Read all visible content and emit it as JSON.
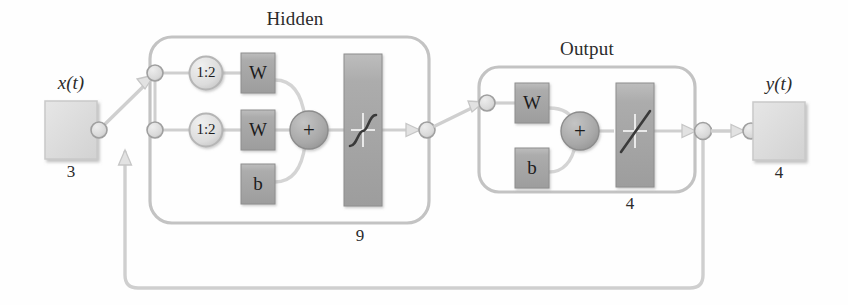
{
  "diagram": {
    "type": "neural-network-block-diagram",
    "title_visible": false,
    "background_color": "#fefefe",
    "line_color": "#b9b9b9",
    "block_fill": "#a9a9a9",
    "light_block_fill": "#dcdcdc",
    "text_color": "#2b2b2b"
  },
  "groups": {
    "hidden": {
      "label": "Hidden",
      "size_label": "9"
    },
    "output": {
      "label": "Output",
      "size_label": "4"
    }
  },
  "io": {
    "input": {
      "label": "x(t)",
      "label_plain": "x(t)",
      "size_label": "3"
    },
    "output": {
      "label": "y(t)",
      "label_plain": "y(t)",
      "size_label": "4"
    }
  },
  "hidden_layer": {
    "delays": [
      {
        "label": "1:2",
        "name": "input-delay"
      },
      {
        "label": "1:2",
        "name": "feedback-delay"
      }
    ],
    "weights": [
      {
        "label": "W",
        "name": "input-weight"
      },
      {
        "label": "W",
        "name": "layer-weight"
      }
    ],
    "bias": {
      "label": "b"
    },
    "sum": {
      "label": "+"
    },
    "transfer_function": {
      "name": "tansig",
      "glyph": "sigmoid"
    }
  },
  "output_layer": {
    "weights": [
      {
        "label": "W",
        "name": "output-weight"
      }
    ],
    "bias": {
      "label": "b"
    },
    "sum": {
      "label": "+"
    },
    "transfer_function": {
      "name": "purelin",
      "glyph": "linear"
    }
  },
  "connections": {
    "feedback_loop": true,
    "feedback_from": "output-node",
    "feedback_to": "hidden-second-input-node"
  }
}
